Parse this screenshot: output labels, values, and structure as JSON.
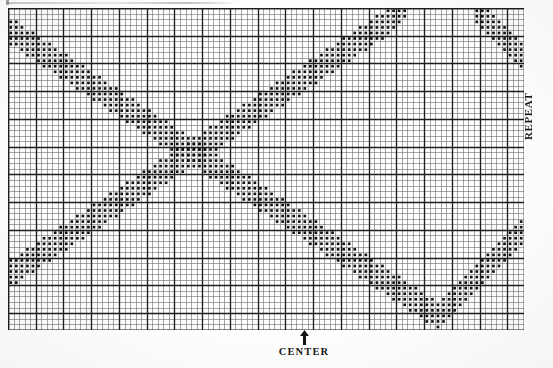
{
  "document": {
    "title": "Cross-Stitch Repeat Chart",
    "type": "stitch-pattern-chart"
  },
  "labels": {
    "repeat": "REPEAT",
    "center": "CENTER",
    "arrow_icon": "up-arrow-icon"
  },
  "colors": {
    "paper": "#fefefe",
    "grid_thin": "#6b6b6b",
    "grid_thick": "#1d1d1d",
    "stitch": "#101010",
    "text": "#161616"
  },
  "chart_data": {
    "type": "heatmap",
    "xlabel": "CENTER",
    "ylabel": "REPEAT",
    "grid": true,
    "cols": 93,
    "rows": 58,
    "cell_px": 5.548,
    "major_every": 5,
    "center_col": 53,
    "legend": [
      {
        "symbol": "filled-square",
        "meaning": "stitch"
      },
      {
        "symbol": "empty-cell",
        "meaning": "no stitch"
      }
    ],
    "series": [
      {
        "name": "stitch-band-upper",
        "comment": "Upper wave: rises left-to-right then falls; expressed as per-column run [col, row_start, row_end] inclusive, 0-indexed from top-left.",
        "runs": [
          [
            0,
            45,
            49
          ],
          [
            1,
            45,
            49
          ],
          [
            2,
            44,
            48
          ],
          [
            3,
            43,
            47
          ],
          [
            4,
            43,
            47
          ],
          [
            5,
            42,
            46
          ],
          [
            6,
            41,
            45
          ],
          [
            7,
            41,
            45
          ],
          [
            8,
            40,
            44
          ],
          [
            9,
            39,
            43
          ],
          [
            10,
            39,
            43
          ],
          [
            11,
            38,
            42
          ],
          [
            12,
            37,
            41
          ],
          [
            13,
            37,
            41
          ],
          [
            14,
            36,
            40
          ],
          [
            15,
            35,
            39
          ],
          [
            16,
            35,
            39
          ],
          [
            17,
            34,
            38
          ],
          [
            18,
            33,
            37
          ],
          [
            19,
            33,
            37
          ],
          [
            20,
            32,
            36
          ],
          [
            21,
            31,
            35
          ],
          [
            22,
            31,
            35
          ],
          [
            23,
            30,
            34
          ],
          [
            24,
            29,
            33
          ],
          [
            25,
            29,
            33
          ],
          [
            26,
            28,
            32
          ],
          [
            27,
            27,
            31
          ],
          [
            28,
            27,
            31
          ],
          [
            29,
            26,
            30
          ],
          [
            30,
            25,
            29
          ],
          [
            31,
            25,
            29
          ],
          [
            32,
            24,
            28
          ],
          [
            33,
            23,
            27
          ],
          [
            34,
            23,
            27
          ],
          [
            35,
            22,
            26
          ],
          [
            36,
            21,
            25
          ],
          [
            37,
            21,
            25
          ],
          [
            38,
            20,
            24
          ],
          [
            39,
            19,
            23
          ],
          [
            40,
            19,
            23
          ],
          [
            41,
            18,
            22
          ],
          [
            42,
            17,
            21
          ],
          [
            43,
            17,
            21
          ],
          [
            44,
            16,
            20
          ],
          [
            45,
            15,
            19
          ],
          [
            46,
            15,
            19
          ],
          [
            47,
            14,
            18
          ],
          [
            48,
            13,
            17
          ],
          [
            49,
            13,
            17
          ],
          [
            50,
            12,
            16
          ],
          [
            51,
            11,
            15
          ],
          [
            52,
            11,
            15
          ],
          [
            53,
            10,
            14
          ],
          [
            54,
            9,
            13
          ],
          [
            55,
            9,
            13
          ],
          [
            56,
            8,
            12
          ],
          [
            57,
            7,
            11
          ],
          [
            58,
            7,
            11
          ],
          [
            59,
            6,
            10
          ],
          [
            60,
            5,
            9
          ],
          [
            61,
            5,
            9
          ],
          [
            62,
            4,
            8
          ],
          [
            63,
            3,
            7
          ],
          [
            64,
            3,
            7
          ],
          [
            65,
            2,
            6
          ],
          [
            66,
            1,
            5
          ],
          [
            67,
            1,
            5
          ],
          [
            68,
            0,
            4
          ],
          [
            69,
            0,
            3
          ],
          [
            70,
            0,
            2
          ],
          [
            71,
            0,
            1
          ]
        ]
      },
      {
        "name": "stitch-band-lower",
        "comment": "Lower wave: descends left-to-right from top-left, bottoms out, then climbs to the right edge.",
        "runs": [
          [
            0,
            2,
            6
          ],
          [
            1,
            2,
            6
          ],
          [
            2,
            3,
            7
          ],
          [
            3,
            4,
            8
          ],
          [
            4,
            4,
            8
          ],
          [
            5,
            5,
            9
          ],
          [
            6,
            6,
            10
          ],
          [
            7,
            6,
            10
          ],
          [
            8,
            7,
            11
          ],
          [
            9,
            8,
            12
          ],
          [
            10,
            8,
            12
          ],
          [
            11,
            9,
            13
          ],
          [
            12,
            10,
            14
          ],
          [
            13,
            10,
            14
          ],
          [
            14,
            11,
            15
          ],
          [
            15,
            12,
            16
          ],
          [
            16,
            12,
            16
          ],
          [
            17,
            13,
            17
          ],
          [
            18,
            14,
            18
          ],
          [
            19,
            14,
            18
          ],
          [
            20,
            15,
            19
          ],
          [
            21,
            16,
            20
          ],
          [
            22,
            16,
            20
          ],
          [
            23,
            17,
            21
          ],
          [
            24,
            18,
            22
          ],
          [
            25,
            18,
            22
          ],
          [
            26,
            19,
            23
          ],
          [
            27,
            20,
            24
          ],
          [
            28,
            20,
            24
          ],
          [
            29,
            21,
            25
          ],
          [
            30,
            22,
            26
          ],
          [
            31,
            22,
            26
          ],
          [
            32,
            23,
            27
          ],
          [
            33,
            24,
            28
          ],
          [
            34,
            24,
            28
          ],
          [
            35,
            25,
            29
          ],
          [
            36,
            26,
            30
          ],
          [
            37,
            26,
            30
          ],
          [
            38,
            27,
            31
          ],
          [
            39,
            28,
            32
          ],
          [
            40,
            28,
            32
          ],
          [
            41,
            29,
            33
          ],
          [
            42,
            30,
            34
          ],
          [
            43,
            30,
            34
          ],
          [
            44,
            31,
            35
          ],
          [
            45,
            32,
            36
          ],
          [
            46,
            32,
            36
          ],
          [
            47,
            33,
            37
          ],
          [
            48,
            34,
            38
          ],
          [
            49,
            34,
            38
          ],
          [
            50,
            35,
            39
          ],
          [
            51,
            36,
            40
          ],
          [
            52,
            36,
            40
          ],
          [
            53,
            37,
            41
          ],
          [
            54,
            38,
            42
          ],
          [
            55,
            38,
            42
          ],
          [
            56,
            39,
            43
          ],
          [
            57,
            40,
            44
          ],
          [
            58,
            40,
            44
          ],
          [
            59,
            41,
            45
          ],
          [
            60,
            42,
            46
          ],
          [
            61,
            42,
            46
          ],
          [
            62,
            43,
            47
          ],
          [
            63,
            44,
            48
          ],
          [
            64,
            44,
            48
          ],
          [
            65,
            45,
            49
          ],
          [
            66,
            46,
            50
          ],
          [
            67,
            46,
            50
          ],
          [
            68,
            47,
            51
          ],
          [
            69,
            48,
            52
          ],
          [
            70,
            48,
            52
          ],
          [
            71,
            49,
            53
          ],
          [
            72,
            50,
            54
          ],
          [
            73,
            50,
            54
          ],
          [
            74,
            51,
            55
          ],
          [
            75,
            52,
            56
          ],
          [
            76,
            52,
            56
          ],
          [
            77,
            53,
            57
          ],
          [
            78,
            52,
            56
          ],
          [
            79,
            51,
            55
          ],
          [
            80,
            50,
            54
          ],
          [
            81,
            49,
            53
          ],
          [
            82,
            48,
            52
          ],
          [
            83,
            47,
            51
          ],
          [
            84,
            46,
            50
          ],
          [
            85,
            45,
            49
          ],
          [
            86,
            44,
            48
          ],
          [
            87,
            43,
            47
          ],
          [
            88,
            42,
            46
          ],
          [
            89,
            41,
            45
          ],
          [
            90,
            40,
            44
          ],
          [
            91,
            39,
            43
          ],
          [
            92,
            38,
            42
          ]
        ]
      },
      {
        "name": "stitch-band-top-right",
        "comment": "Short band re-entering at the top-right corner after the upper wave exits the top edge.",
        "runs": [
          [
            84,
            0,
            2
          ],
          [
            85,
            0,
            3
          ],
          [
            86,
            0,
            4
          ],
          [
            87,
            1,
            5
          ],
          [
            88,
            2,
            6
          ],
          [
            89,
            3,
            7
          ],
          [
            90,
            4,
            8
          ],
          [
            91,
            5,
            9
          ],
          [
            92,
            6,
            10
          ]
        ]
      }
    ]
  }
}
